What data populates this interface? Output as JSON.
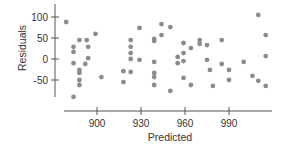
{
  "chart_data": {
    "type": "scatter",
    "title": "",
    "xlabel": "Predicted",
    "ylabel": "Residuals",
    "xlim": [
      872,
      1018
    ],
    "ylim": [
      -105,
      128
    ],
    "x_ticks": [
      900,
      930,
      960,
      990
    ],
    "y_ticks": [
      100,
      50,
      0,
      -50
    ],
    "x_tick_labels": [
      "900",
      "930",
      "960",
      "990"
    ],
    "y_tick_labels": [
      "100",
      "50",
      "0",
      "-50"
    ],
    "grid": false,
    "legend": null,
    "marker_color": "#8c8c8c",
    "points": [
      {
        "x": 879,
        "y": 88
      },
      {
        "x": 884,
        "y": 29
      },
      {
        "x": 884,
        "y": 17
      },
      {
        "x": 884,
        "y": -10
      },
      {
        "x": 884,
        "y": -90
      },
      {
        "x": 888,
        "y": 45
      },
      {
        "x": 888,
        "y": -26
      },
      {
        "x": 888,
        "y": -33
      },
      {
        "x": 888,
        "y": -50
      },
      {
        "x": 888,
        "y": -62
      },
      {
        "x": 893,
        "y": 45
      },
      {
        "x": 894,
        "y": 29
      },
      {
        "x": 894,
        "y": 2
      },
      {
        "x": 892,
        "y": -12
      },
      {
        "x": 899,
        "y": 60
      },
      {
        "x": 903,
        "y": -43
      },
      {
        "x": 918,
        "y": -29
      },
      {
        "x": 918,
        "y": -55
      },
      {
        "x": 923,
        "y": 45
      },
      {
        "x": 923,
        "y": 29
      },
      {
        "x": 923,
        "y": 14
      },
      {
        "x": 923,
        "y": 0
      },
      {
        "x": 923,
        "y": -31
      },
      {
        "x": 929,
        "y": 74
      },
      {
        "x": 929,
        "y": -2
      },
      {
        "x": 939,
        "y": 48
      },
      {
        "x": 939,
        "y": 43
      },
      {
        "x": 939,
        "y": -7
      },
      {
        "x": 939,
        "y": -33
      },
      {
        "x": 939,
        "y": -43
      },
      {
        "x": 939,
        "y": -62
      },
      {
        "x": 944,
        "y": 83
      },
      {
        "x": 944,
        "y": 57
      },
      {
        "x": 950,
        "y": 76
      },
      {
        "x": 950,
        "y": -76
      },
      {
        "x": 955,
        "y": 5
      },
      {
        "x": 955,
        "y": -10
      },
      {
        "x": 959,
        "y": 38
      },
      {
        "x": 959,
        "y": 14
      },
      {
        "x": 959,
        "y": -5
      },
      {
        "x": 959,
        "y": -45
      },
      {
        "x": 964,
        "y": 26
      },
      {
        "x": 964,
        "y": -62
      },
      {
        "x": 970,
        "y": 45
      },
      {
        "x": 970,
        "y": 36
      },
      {
        "x": 975,
        "y": 33
      },
      {
        "x": 975,
        "y": -2
      },
      {
        "x": 977,
        "y": -26
      },
      {
        "x": 979,
        "y": -64
      },
      {
        "x": 985,
        "y": 45
      },
      {
        "x": 985,
        "y": -12
      },
      {
        "x": 990,
        "y": -26
      },
      {
        "x": 990,
        "y": -50
      },
      {
        "x": 1000,
        "y": -7
      },
      {
        "x": 1006,
        "y": -40
      },
      {
        "x": 1010,
        "y": -52
      },
      {
        "x": 1015,
        "y": -64
      },
      {
        "x": 1010,
        "y": 105
      },
      {
        "x": 1015,
        "y": 57
      },
      {
        "x": 1015,
        "y": 7
      }
    ]
  }
}
